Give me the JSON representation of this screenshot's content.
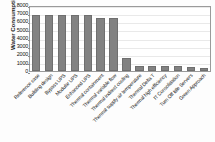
{
  "chart_data": {
    "type": "bar",
    "title": "",
    "xlabel": "",
    "ylabel": "Water Consumption [m³]",
    "ylim": [
      0,
      8000
    ],
    "ytick_labels": [
      "8000",
      "7000",
      "6000",
      "5000",
      "4000",
      "3000",
      "2000",
      "1000",
      "0"
    ],
    "ytick_values": [
      8000,
      7000,
      6000,
      5000,
      4000,
      3000,
      2000,
      1000,
      0
    ],
    "grid": true,
    "legend": null,
    "bar_color": "#828282",
    "categories": [
      "Reference case",
      "Building design",
      "Bypass UPS",
      "Modular UPS",
      "Enhanced UPS",
      "Thermal containment",
      "Thermal variable flow",
      "Thermal indirect cooling",
      "Thermal supply air temperature",
      "Thermal Delta T",
      "Thermal high efficiency",
      "IT Consolidation",
      "Turn Off Idle Servers",
      "Green Approach"
    ],
    "values": [
      6700,
      6700,
      6700,
      6700,
      6700,
      6400,
      6400,
      1500,
      600,
      580,
      560,
      540,
      380,
      360
    ]
  }
}
